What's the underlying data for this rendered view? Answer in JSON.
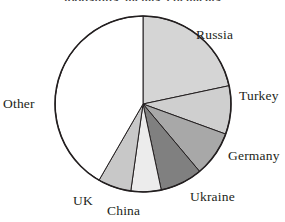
{
  "chart_data": {
    "type": "pie",
    "title": "foodstuffs, metals, chemicals",
    "xlabel": "",
    "ylabel": "",
    "grid": false,
    "legend": "none",
    "labels_position": "outside-callout",
    "start_angle_deg": 0,
    "direction": "clockwise",
    "categories": [
      "Russia",
      "Turkey",
      "Germany",
      "Ukraine",
      "China",
      "UK",
      "Other"
    ],
    "values": [
      21.7,
      8.9,
      8.3,
      7.8,
      5.6,
      6.1,
      41.6
    ],
    "slice_angles_deg": [
      78,
      32,
      30,
      28,
      20,
      22,
      150
    ],
    "colors": [
      "#d5d5d5",
      "#cfcfcf",
      "#a8a8a8",
      "#808080",
      "#ececec",
      "#c8c8c8",
      "#ffffff"
    ],
    "slices": [
      {
        "label": "Russia",
        "value": 21.7,
        "angle_deg": 78,
        "color": "#d5d5d5"
      },
      {
        "label": "Turkey",
        "value": 8.9,
        "angle_deg": 32,
        "color": "#cfcfcf"
      },
      {
        "label": "Germany",
        "value": 8.3,
        "angle_deg": 30,
        "color": "#a8a8a8"
      },
      {
        "label": "Ukraine",
        "value": 7.8,
        "angle_deg": 28,
        "color": "#808080"
      },
      {
        "label": "China",
        "value": 5.6,
        "angle_deg": 20,
        "color": "#ececec"
      },
      {
        "label": "UK",
        "value": 6.1,
        "angle_deg": 22,
        "color": "#c8c8c8"
      },
      {
        "label": "Other",
        "value": 41.6,
        "angle_deg": 150,
        "color": "#ffffff"
      }
    ],
    "outline_color": "#231f20",
    "text_color": "#231f20"
  },
  "labels": {
    "russia": "Russia",
    "turkey": "Turkey",
    "germany": "Germany",
    "ukraine": "Ukraine",
    "china": "China",
    "uk": "UK",
    "other": "Other"
  }
}
